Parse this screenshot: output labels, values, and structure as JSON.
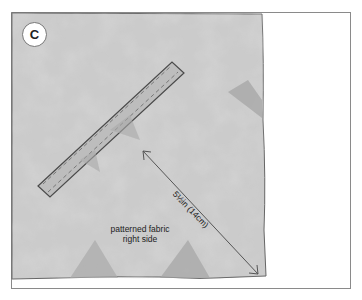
{
  "figure": {
    "step_label": "C",
    "fabric_label_line1": "patterned fabric",
    "fabric_label_line2": "right side",
    "measurement": "5½in (14cm)"
  },
  "colors": {
    "fabric": "#c9c9c9",
    "fabric_dark": "#a9a9a9",
    "outline": "#555555",
    "frame": "#8a8a8a"
  }
}
